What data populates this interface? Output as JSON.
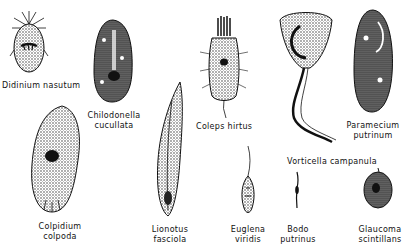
{
  "figure": {
    "type": "illustration",
    "background": "#ffffff",
    "ink": "#111111"
  },
  "organisms": [
    {
      "id": "didinium",
      "line1": "Didinium nasutum",
      "line2": ""
    },
    {
      "id": "chilodonella",
      "line1": "Chilodonella",
      "line2": "cucullata"
    },
    {
      "id": "coleps",
      "line1": "Coleps hirtus",
      "line2": ""
    },
    {
      "id": "vorticella",
      "line1": "Vorticella campanula",
      "line2": ""
    },
    {
      "id": "paramecium",
      "line1": "Paramecium",
      "line2": "putrinum"
    },
    {
      "id": "colpidium",
      "line1": "Colpidium",
      "line2": "colpoda"
    },
    {
      "id": "lionotus",
      "line1": "Lionotus",
      "line2": "fasciola"
    },
    {
      "id": "euglena",
      "line1": "Euglena",
      "line2": "viridis"
    },
    {
      "id": "bodo",
      "line1": "Bodo",
      "line2": "putrinus"
    },
    {
      "id": "glaucoma",
      "line1": "Glaucoma",
      "line2": "scintillans"
    }
  ]
}
